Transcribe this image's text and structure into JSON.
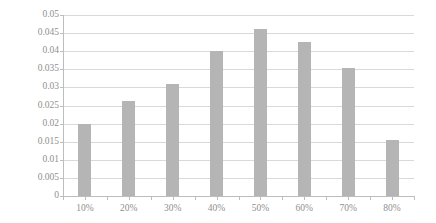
{
  "chart_data": {
    "type": "bar",
    "title": "",
    "subtitle": "",
    "xlabel": "",
    "ylabel": "",
    "categories": [
      "10%",
      "20%",
      "30%",
      "40%",
      "50%",
      "60%",
      "70%",
      "80%"
    ],
    "values": [
      0.02,
      0.0262,
      0.0309,
      0.04,
      0.046,
      0.0425,
      0.0355,
      0.0155
    ],
    "series": [
      {
        "name": "",
        "values": [
          0.02,
          0.0262,
          0.0309,
          0.04,
          0.046,
          0.0425,
          0.0355,
          0.0155
        ]
      }
    ],
    "ylim": [
      0,
      0.05
    ],
    "ytick_labels": [
      "0.05",
      "0.045",
      "0.04",
      "0.035",
      "0.03",
      "0.025",
      "0.02",
      "0.015",
      "0.01",
      "0.005",
      "0"
    ],
    "ytick_values": [
      0.05,
      0.045,
      0.04,
      0.035,
      0.03,
      0.025,
      0.02,
      0.015,
      0.01,
      0.005,
      0
    ],
    "ytick_step": 0.005,
    "grid": true,
    "grid_axis": "y",
    "legend": false,
    "legend_position": "none",
    "annotations": [],
    "colors": {
      "bar": "#b5b5b5",
      "gridline": "#d9d9d9",
      "axis": "#bdbdbd",
      "text": "#8f8f8f",
      "background": "#ffffff"
    }
  }
}
